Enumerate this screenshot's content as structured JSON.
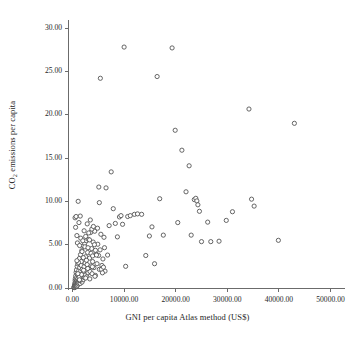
{
  "chart_data": {
    "type": "scatter",
    "title": "",
    "subtitle": "",
    "xlabel": "GNI per capita Atlas method (US$)",
    "ylabel_text": "CO2 emissions per capita",
    "ylabel_prefix": "CO",
    "ylabel_subscript": "2",
    "ylabel_suffix": " emissions per capita",
    "xlim": [
      0,
      50000
    ],
    "ylim": [
      0,
      30
    ],
    "xticks": [
      0,
      10000,
      20000,
      30000,
      40000,
      50000
    ],
    "yticks": [
      0,
      5,
      10,
      15,
      20,
      25,
      30
    ],
    "xtick_labels": [
      "0.00",
      "10000.00",
      "20000.00",
      "30000.00",
      "40000.00",
      "50000.00"
    ],
    "ytick_labels": [
      "0.00",
      "5.00",
      "10.00",
      "15.00",
      "20.00",
      "25.00",
      "30.00"
    ],
    "grid": false,
    "legend": null,
    "legend_position": "none",
    "marker": {
      "shape": "circle",
      "filled": false,
      "edge_color": "#555555",
      "face_color": "#ffffff",
      "size_px": 4.2,
      "edge_width_px": 0.9
    },
    "axis_style": {
      "spines": [
        "left",
        "bottom"
      ],
      "spine_color": "#6b6b6b",
      "tick_direction": "out",
      "tick_length_px": 4
    },
    "n_points": 198,
    "series": [
      {
        "name": "countries",
        "points": [
          [
            280,
            0.05
          ],
          [
            320,
            0.1
          ],
          [
            350,
            0.2
          ],
          [
            380,
            0.05
          ],
          [
            400,
            0.3
          ],
          [
            420,
            0.15
          ],
          [
            440,
            0.4
          ],
          [
            460,
            0.08
          ],
          [
            470,
            0.6
          ],
          [
            490,
            0.25
          ],
          [
            510,
            0.9
          ],
          [
            530,
            0.35
          ],
          [
            550,
            0.12
          ],
          [
            560,
            1.1
          ],
          [
            580,
            0.45
          ],
          [
            600,
            0.2
          ],
          [
            620,
            1.4
          ],
          [
            640,
            0.55
          ],
          [
            650,
            0.3
          ],
          [
            670,
            0.75
          ],
          [
            690,
            0.18
          ],
          [
            700,
            1.8
          ],
          [
            720,
            0.5
          ],
          [
            740,
            0.95
          ],
          [
            760,
            0.28
          ],
          [
            780,
            2.1
          ],
          [
            800,
            0.65
          ],
          [
            820,
            0.38
          ],
          [
            840,
            1.25
          ],
          [
            860,
            0.22
          ],
          [
            880,
            0.85
          ],
          [
            900,
            2.5
          ],
          [
            920,
            0.42
          ],
          [
            940,
            1.55
          ],
          [
            960,
            0.7
          ],
          [
            980,
            0.33
          ],
          [
            1000,
            1.05
          ],
          [
            1030,
            2.8
          ],
          [
            1060,
            0.58
          ],
          [
            1090,
            1.7
          ],
          [
            1120,
            0.48
          ],
          [
            1150,
            3.1
          ],
          [
            1180,
            0.92
          ],
          [
            1210,
            2.0
          ],
          [
            1240,
            0.62
          ],
          [
            1280,
            1.35
          ],
          [
            1320,
            3.4
          ],
          [
            1360,
            0.78
          ],
          [
            1400,
            2.35
          ],
          [
            1450,
            1.15
          ],
          [
            1500,
            0.52
          ],
          [
            1550,
            3.85
          ],
          [
            1600,
            1.95
          ],
          [
            1650,
            0.88
          ],
          [
            1700,
            2.6
          ],
          [
            1750,
            1.45
          ],
          [
            1800,
            4.3
          ],
          [
            1850,
            0.68
          ],
          [
            1900,
            2.15
          ],
          [
            1950,
            1.6
          ],
          [
            2000,
            3.25
          ],
          [
            2060,
            0.95
          ],
          [
            2120,
            4.85
          ],
          [
            2180,
            1.85
          ],
          [
            2240,
            2.45
          ],
          [
            2300,
            1.2
          ],
          [
            2360,
            5.15
          ],
          [
            2420,
            2.9
          ],
          [
            2480,
            1.5
          ],
          [
            2540,
            3.6
          ],
          [
            2600,
            2.05
          ],
          [
            2680,
            5.45
          ],
          [
            2760,
            1.3
          ],
          [
            2840,
            2.7
          ],
          [
            2920,
            4.1
          ],
          [
            3000,
            1.75
          ],
          [
            3100,
            5.6
          ],
          [
            3200,
            2.25
          ],
          [
            3300,
            3.45
          ],
          [
            3400,
            1.9
          ],
          [
            3500,
            6.4
          ],
          [
            3600,
            2.55
          ],
          [
            3700,
            4.55
          ],
          [
            3800,
            1.65
          ],
          [
            3900,
            3.05
          ],
          [
            4000,
            5.3
          ],
          [
            4150,
            2.35
          ],
          [
            4300,
            6.55
          ],
          [
            4450,
            1.45
          ],
          [
            4600,
            3.9
          ],
          [
            4750,
            2.8
          ],
          [
            4900,
            5.05
          ],
          [
            5050,
            3.75
          ],
          [
            5200,
            2.15
          ],
          [
            5350,
            4.4
          ],
          [
            5500,
            6.2
          ],
          [
            5700,
            2.6
          ],
          [
            5900,
            3.35
          ],
          [
            6100,
            5.85
          ],
          [
            6300,
            1.95
          ],
          [
            500,
            8.1
          ],
          [
            600,
            7.0
          ],
          [
            700,
            8.25
          ],
          [
            850,
            6.05
          ],
          [
            950,
            5.2
          ],
          [
            1100,
            10.0
          ],
          [
            1250,
            7.55
          ],
          [
            1380,
            4.9
          ],
          [
            1500,
            8.3
          ],
          [
            1600,
            5.75
          ],
          [
            1700,
            3.05
          ],
          [
            1850,
            4.2
          ],
          [
            2000,
            5.45
          ],
          [
            2100,
            3.5
          ],
          [
            2250,
            6.6
          ],
          [
            2400,
            4.75
          ],
          [
            2550,
            5.95
          ],
          [
            2700,
            3.2
          ],
          [
            2850,
            7.4
          ],
          [
            3000,
            4.65
          ],
          [
            3150,
            6.35
          ],
          [
            3300,
            5.55
          ],
          [
            3450,
            7.85
          ],
          [
            3600,
            4.0
          ],
          [
            3750,
            6.8
          ],
          [
            3900,
            3.7
          ],
          [
            4050,
            7.1
          ],
          [
            4250,
            5.0
          ],
          [
            4450,
            4.35
          ],
          [
            4650,
            3.8
          ],
          [
            4850,
            6.9
          ],
          [
            5100,
            11.65
          ],
          [
            5200,
            9.85
          ],
          [
            5400,
            24.2
          ],
          [
            5600,
            2.15
          ],
          [
            5800,
            1.75
          ],
          [
            6000,
            2.4
          ],
          [
            6200,
            4.65
          ],
          [
            6500,
            11.55
          ],
          [
            6800,
            3.8
          ],
          [
            7100,
            7.2
          ],
          [
            7500,
            13.4
          ],
          [
            7900,
            9.15
          ],
          [
            8300,
            7.45
          ],
          [
            8700,
            5.9
          ],
          [
            9100,
            8.2
          ],
          [
            9400,
            8.35
          ],
          [
            9700,
            7.35
          ],
          [
            10000,
            27.8
          ],
          [
            10300,
            2.5
          ],
          [
            10700,
            8.25
          ],
          [
            11200,
            8.35
          ],
          [
            12000,
            8.5
          ],
          [
            12600,
            8.55
          ],
          [
            13400,
            8.5
          ],
          [
            14200,
            3.75
          ],
          [
            14900,
            6.0
          ],
          [
            15400,
            7.05
          ],
          [
            15900,
            2.8
          ],
          [
            16400,
            24.4
          ],
          [
            16900,
            10.3
          ],
          [
            17600,
            6.1
          ],
          [
            19300,
            27.7
          ],
          [
            19900,
            18.2
          ],
          [
            20400,
            7.55
          ],
          [
            21200,
            15.9
          ],
          [
            22000,
            11.1
          ],
          [
            22600,
            14.1
          ],
          [
            23000,
            6.1
          ],
          [
            23600,
            10.2
          ],
          [
            23900,
            10.35
          ],
          [
            24100,
            10.05
          ],
          [
            24300,
            9.6
          ],
          [
            24600,
            8.85
          ],
          [
            25000,
            5.35
          ],
          [
            26200,
            7.6
          ],
          [
            26800,
            5.35
          ],
          [
            28400,
            5.4
          ],
          [
            29800,
            7.8
          ],
          [
            31000,
            8.8
          ],
          [
            34200,
            20.65
          ],
          [
            34700,
            10.25
          ],
          [
            35200,
            9.45
          ],
          [
            39900,
            5.5
          ],
          [
            43000,
            19.0
          ],
          [
            1150,
            2.95
          ],
          [
            1300,
            1.25
          ],
          [
            1450,
            0.85
          ],
          [
            1750,
            1.55
          ],
          [
            2150,
            2.05
          ],
          [
            2550,
            1.15
          ],
          [
            2950,
            2.25
          ],
          [
            3350,
            1.05
          ],
          [
            3850,
            2.45
          ],
          [
            4350,
            1.35
          ],
          [
            850,
            3.15
          ],
          [
            1050,
            1.65
          ],
          [
            1350,
            0.95
          ]
        ]
      }
    ]
  }
}
